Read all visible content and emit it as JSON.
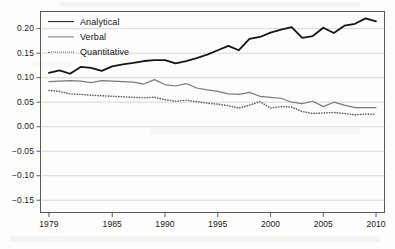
{
  "chart_data": {
    "type": "line",
    "title": "",
    "subtitle": "",
    "xlabel": "",
    "ylabel": "",
    "xlim": [
      1978.2,
      2010.8
    ],
    "ylim": [
      -0.175,
      0.235
    ],
    "grid": true,
    "grid_axis": "y",
    "legend_position": "top-left",
    "x_ticks": [
      1979,
      1985,
      1990,
      1995,
      2000,
      2005,
      2010
    ],
    "x_tick_labels": [
      "1979",
      "1985",
      "1990",
      "1995",
      "2000",
      "2005",
      "2010"
    ],
    "y_ticks": [
      0.2,
      0.15,
      0.1,
      0.05,
      0.0,
      -0.05,
      -0.1,
      -0.15
    ],
    "y_tick_labels": [
      "0.20",
      "0.15",
      "0.10",
      "0.05",
      "0.00",
      "−0.05",
      "−0.10",
      "−0.15"
    ],
    "x": [
      1979,
      1980,
      1981,
      1982,
      1983,
      1984,
      1985,
      1986,
      1987,
      1988,
      1989,
      1990,
      1991,
      1992,
      1993,
      1994,
      1995,
      1996,
      1997,
      1998,
      1999,
      2000,
      2001,
      2002,
      2003,
      2004,
      2005,
      2006,
      2007,
      2008,
      2009,
      2010
    ],
    "series": [
      {
        "name": "Analytical",
        "color": "#151515",
        "style": "solid",
        "width": 1.8,
        "values": [
          0.11,
          0.115,
          0.108,
          0.122,
          0.12,
          0.114,
          0.123,
          0.127,
          0.13,
          0.134,
          0.136,
          0.136,
          0.129,
          0.134,
          0.14,
          0.147,
          0.156,
          0.165,
          0.156,
          0.179,
          0.183,
          0.192,
          0.198,
          0.203,
          0.181,
          0.185,
          0.202,
          0.191,
          0.206,
          0.21,
          0.221,
          0.215
        ]
      },
      {
        "name": "Verbal",
        "color": "#7a7a7a",
        "style": "solid",
        "width": 1.2,
        "values": [
          0.092,
          0.093,
          0.094,
          0.093,
          0.09,
          0.094,
          0.093,
          0.092,
          0.091,
          0.087,
          0.096,
          0.086,
          0.083,
          0.088,
          0.079,
          0.075,
          0.072,
          0.067,
          0.066,
          0.07,
          0.062,
          0.06,
          0.058,
          0.05,
          0.047,
          0.052,
          0.041,
          0.05,
          0.044,
          0.039,
          0.039,
          0.039
        ]
      },
      {
        "name": "Quantitative",
        "color": "#5e5e5e",
        "style": "dotted",
        "width": 1.6,
        "values": [
          0.074,
          0.072,
          0.067,
          0.066,
          0.064,
          0.063,
          0.062,
          0.061,
          0.06,
          0.059,
          0.06,
          0.055,
          0.052,
          0.054,
          0.051,
          0.048,
          0.046,
          0.043,
          0.038,
          0.044,
          0.051,
          0.038,
          0.041,
          0.04,
          0.031,
          0.027,
          0.028,
          0.029,
          0.027,
          0.024,
          0.026,
          0.025
        ]
      }
    ]
  },
  "legend": {
    "items": [
      {
        "label": "Analytical"
      },
      {
        "label": "Verbal"
      },
      {
        "label": "Quantitative"
      }
    ]
  }
}
